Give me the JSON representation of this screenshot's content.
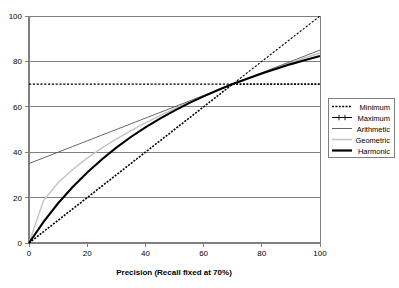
{
  "chart_data": {
    "type": "line",
    "title": "",
    "xlabel": "Precision (Recall fixed at 70%)",
    "ylabel": "",
    "xlim": [
      0,
      100
    ],
    "ylim": [
      0,
      100
    ],
    "grid": true,
    "legend_position": "right",
    "xticks": [
      "0",
      "20",
      "40",
      "60",
      "80",
      "100"
    ],
    "yticks": [
      "0",
      "20",
      "40",
      "60",
      "80",
      "100"
    ],
    "x": [
      0,
      5,
      10,
      15,
      20,
      25,
      30,
      35,
      40,
      45,
      50,
      55,
      60,
      65,
      70,
      75,
      80,
      85,
      90,
      95,
      100
    ],
    "series": [
      {
        "name": "Minimum",
        "style": "dotted",
        "color": "#000000",
        "values": [
          0,
          5,
          10,
          15,
          20,
          25,
          30,
          35,
          40,
          45,
          50,
          55,
          60,
          65,
          70,
          70,
          70,
          70,
          70,
          70,
          70
        ]
      },
      {
        "name": "Maximum",
        "style": "dashed-marker",
        "color": "#000000",
        "values": [
          70,
          70,
          70,
          70,
          70,
          70,
          70,
          70,
          70,
          70,
          70,
          70,
          70,
          70,
          70,
          75,
          80,
          85,
          90,
          95,
          100
        ]
      },
      {
        "name": "Arithmetic",
        "style": "thin-line",
        "color": "#555555",
        "values": [
          35,
          37.5,
          40,
          42.5,
          45,
          47.5,
          50,
          52.5,
          55,
          57.5,
          60,
          62.5,
          65,
          67.5,
          70,
          72.5,
          75,
          77.5,
          80,
          82.5,
          85
        ]
      },
      {
        "name": "Geometric",
        "style": "light-line",
        "color": "#c4c4c4",
        "values": [
          0,
          18.7,
          26.5,
          32.4,
          37.4,
          41.8,
          45.8,
          49.5,
          52.9,
          56.1,
          59.2,
          62.0,
          64.8,
          67.5,
          70.0,
          72.5,
          74.8,
          77.1,
          79.4,
          81.6,
          83.7
        ]
      },
      {
        "name": "Harmonic",
        "style": "thick-line",
        "color": "#000000",
        "values": [
          0,
          9.33,
          17.5,
          24.7,
          31.1,
          36.8,
          42.0,
          46.7,
          50.9,
          54.8,
          58.3,
          61.6,
          64.6,
          67.4,
          70.0,
          72.4,
          74.7,
          76.8,
          78.8,
          80.6,
          82.4
        ]
      }
    ]
  },
  "legend": {
    "items": [
      {
        "label": "Minimum"
      },
      {
        "label": "Maximum"
      },
      {
        "label": "Arithmetic"
      },
      {
        "label": "Geometric"
      },
      {
        "label": "Harmonic"
      }
    ]
  }
}
